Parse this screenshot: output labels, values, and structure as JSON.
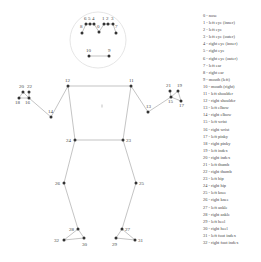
{
  "diagram": {
    "face_circle": {
      "cx": 98,
      "cy": 40,
      "r": 28,
      "stroke": "#e6e6e6"
    },
    "bone_color": "#aaaaaa",
    "point_color": "#333333",
    "landmarks": [
      {
        "id": 0,
        "x": 99,
        "y": 32,
        "lx": 97,
        "ly": 28
      },
      {
        "id": 1,
        "x": 104,
        "y": 24,
        "lx": 102,
        "ly": 20
      },
      {
        "id": 2,
        "x": 108,
        "y": 24,
        "lx": 106,
        "ly": 20
      },
      {
        "id": 3,
        "x": 113,
        "y": 24,
        "lx": 111,
        "ly": 20
      },
      {
        "id": 4,
        "x": 94,
        "y": 24,
        "lx": 92,
        "ly": 20
      },
      {
        "id": 5,
        "x": 90,
        "y": 24,
        "lx": 88,
        "ly": 20
      },
      {
        "id": 6,
        "x": 86,
        "y": 24,
        "lx": 84,
        "ly": 20
      },
      {
        "id": 7,
        "x": 116,
        "y": 33,
        "lx": 115,
        "ly": 28
      },
      {
        "id": 8,
        "x": 82,
        "y": 33,
        "lx": 80,
        "ly": 28
      },
      {
        "id": 9,
        "x": 109,
        "y": 56,
        "lx": 108,
        "ly": 52
      },
      {
        "id": 10,
        "x": 89,
        "y": 56,
        "lx": 86,
        "ly": 52
      },
      {
        "id": 11,
        "x": 131,
        "y": 86,
        "lx": 129,
        "ly": 82
      },
      {
        "id": 12,
        "x": 68,
        "y": 86,
        "lx": 65,
        "ly": 82
      },
      {
        "id": 13,
        "x": 148,
        "y": 112,
        "lx": 146,
        "ly": 108
      },
      {
        "id": 14,
        "x": 51,
        "y": 117,
        "lx": 48,
        "ly": 113
      },
      {
        "id": 15,
        "x": 171,
        "y": 97,
        "lx": 168,
        "ly": 103
      },
      {
        "id": 16,
        "x": 29,
        "y": 98,
        "lx": 25,
        "ly": 104
      },
      {
        "id": 17,
        "x": 181,
        "y": 101,
        "lx": 179,
        "ly": 107
      },
      {
        "id": 18,
        "x": 19,
        "y": 98,
        "lx": 15,
        "ly": 104
      },
      {
        "id": 19,
        "x": 178,
        "y": 91,
        "lx": 177,
        "ly": 87
      },
      {
        "id": 20,
        "x": 23,
        "y": 92,
        "lx": 19,
        "ly": 88
      },
      {
        "id": 21,
        "x": 170,
        "y": 91,
        "lx": 166,
        "ly": 87
      },
      {
        "id": 22,
        "x": 29,
        "y": 92,
        "lx": 27,
        "ly": 88
      },
      {
        "id": 23,
        "x": 123,
        "y": 140,
        "lx": 126,
        "ly": 142
      },
      {
        "id": 24,
        "x": 75,
        "y": 140,
        "lx": 66,
        "ly": 142
      },
      {
        "id": 25,
        "x": 136,
        "y": 183,
        "lx": 139,
        "ly": 185
      },
      {
        "id": 26,
        "x": 64,
        "y": 183,
        "lx": 55,
        "ly": 185
      },
      {
        "id": 27,
        "x": 122,
        "y": 229,
        "lx": 125,
        "ly": 231
      },
      {
        "id": 28,
        "x": 78,
        "y": 229,
        "lx": 69,
        "ly": 231
      },
      {
        "id": 29,
        "x": 116,
        "y": 238,
        "lx": 112,
        "ly": 246
      },
      {
        "id": 30,
        "x": 84,
        "y": 238,
        "lx": 82,
        "ly": 246
      },
      {
        "id": 31,
        "x": 135,
        "y": 240,
        "lx": 138,
        "ly": 242
      },
      {
        "id": 32,
        "x": 64,
        "y": 240,
        "lx": 54,
        "ly": 242
      }
    ],
    "connections": [
      [
        0,
        4
      ],
      [
        4,
        5
      ],
      [
        5,
        6
      ],
      [
        6,
        8
      ],
      [
        0,
        1
      ],
      [
        1,
        2
      ],
      [
        2,
        3
      ],
      [
        3,
        7
      ],
      [
        9,
        10
      ],
      [
        11,
        12
      ],
      [
        11,
        13
      ],
      [
        13,
        15
      ],
      [
        15,
        17
      ],
      [
        15,
        19
      ],
      [
        15,
        21
      ],
      [
        17,
        19
      ],
      [
        12,
        14
      ],
      [
        14,
        16
      ],
      [
        16,
        18
      ],
      [
        16,
        20
      ],
      [
        16,
        22
      ],
      [
        18,
        20
      ],
      [
        11,
        23
      ],
      [
        12,
        24
      ],
      [
        23,
        24
      ],
      [
        23,
        25
      ],
      [
        25,
        27
      ],
      [
        27,
        29
      ],
      [
        27,
        31
      ],
      [
        29,
        31
      ],
      [
        24,
        26
      ],
      [
        26,
        28
      ],
      [
        28,
        30
      ],
      [
        28,
        32
      ],
      [
        30,
        32
      ]
    ],
    "center_mark": {
      "x": 102,
      "y": 106
    }
  },
  "legend": {
    "items": [
      "0 - nose",
      "1 - left eye (inner)",
      "2 - left eye",
      "3 - left eye (outer)",
      "4 - right eye (inner)",
      "5 - right eye",
      "6 - right eye (outer)",
      "7 - left ear",
      "8 - right ear",
      "9 - mouth (left)",
      "10 - mouth (right)",
      "11 - left shoulder",
      "12 - right shoulder",
      "13 - left elbow",
      "14 - right elbow",
      "15 - left wrist",
      "16 - right wrist",
      "17 - left pinky",
      "18 - right pinky",
      "19 - left index",
      "20 - right index",
      "21 - left thumb",
      "22 - right thumb",
      "23 - left hip",
      "24 - right hip",
      "25 - left knee",
      "26 - right knee",
      "27 - left ankle",
      "28 - right ankle",
      "29 - left heel",
      "30 - right heel",
      "31 - left foot index",
      "32 - right foot index"
    ]
  }
}
